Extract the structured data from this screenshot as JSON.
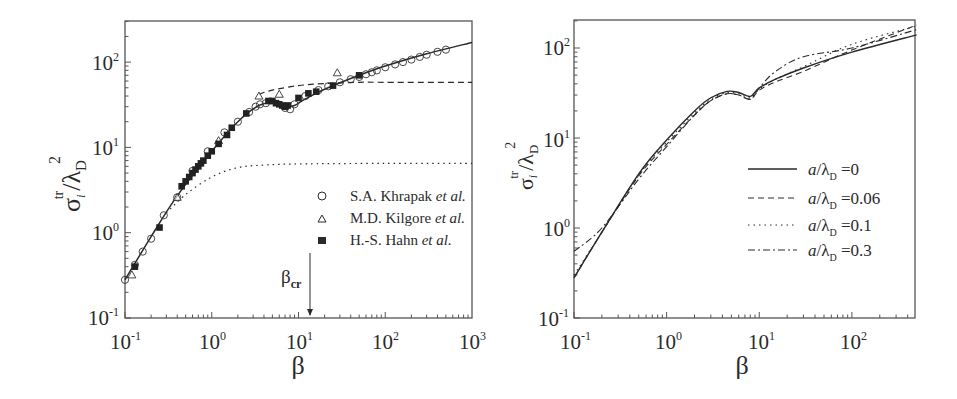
{
  "chart_data": [
    {
      "type": "line",
      "panel": "left",
      "title": "",
      "xlabel": "β",
      "ylabel": "σ_i^tr/λ_D^2",
      "xscale": "log",
      "yscale": "log",
      "xlim": [
        0.1,
        1000
      ],
      "ylim": [
        0.1,
        300
      ],
      "x_tick_labels": [
        "10^-1",
        "10^0",
        "10^1",
        "10^2",
        "10^3"
      ],
      "y_tick_labels": [
        "10^-1",
        "10^0",
        "10^1",
        "10^2"
      ],
      "grid": false,
      "legend_position": "lower right",
      "annotation": {
        "text": "β_cr",
        "x": 13,
        "arrow": "down to x-axis"
      },
      "series": [
        {
          "name": "theory (solid)",
          "style": "solid",
          "x": [
            0.1,
            0.2,
            0.4,
            1,
            2,
            3.5,
            5,
            7,
            9,
            12,
            20,
            50,
            100,
            300,
            1000
          ],
          "y": [
            0.28,
            0.9,
            2.7,
            9,
            20,
            31,
            33,
            30,
            31,
            37,
            48,
            70,
            90,
            125,
            170
          ]
        },
        {
          "name": "dashed asymptote",
          "style": "dashed",
          "x": [
            3.5,
            5,
            10,
            20,
            50,
            100,
            1000
          ],
          "y": [
            42,
            47,
            53,
            56,
            58,
            58,
            58
          ]
        },
        {
          "name": "dotted asymptote",
          "style": "dotted",
          "x": [
            0.3,
            0.5,
            1,
            2,
            4,
            10,
            100,
            1000
          ],
          "y": [
            1.7,
            2.8,
            4.5,
            5.8,
            6.2,
            6.4,
            6.5,
            6.5
          ]
        },
        {
          "name": "S.A. Khrapak et al.",
          "marker": "open-circle",
          "x": [
            0.1,
            0.13,
            0.16,
            0.2,
            0.28,
            0.4,
            0.6,
            0.9,
            1.4,
            2,
            2.7,
            3.2,
            3.6,
            4.2,
            7,
            8,
            9,
            12,
            17,
            22,
            30,
            40,
            50,
            60,
            70,
            80,
            100,
            130,
            160,
            200,
            250,
            300,
            400,
            500
          ],
          "y": [
            0.28,
            0.42,
            0.6,
            0.85,
            1.6,
            2.6,
            5.3,
            9,
            15,
            20,
            26,
            30,
            32,
            33,
            29,
            28,
            32,
            40,
            47,
            52,
            58,
            63,
            67,
            72,
            76,
            80,
            87,
            94,
            100,
            107,
            115,
            122,
            132,
            140
          ]
        },
        {
          "name": "M.D. Kilgore et al.",
          "marker": "open-triangle",
          "x": [
            0.12,
            0.4,
            1.2,
            3.5,
            6,
            28
          ],
          "y": [
            0.32,
            2.6,
            12,
            40,
            42,
            75
          ]
        },
        {
          "name": "H.-S. Hahn et al.",
          "marker": "filled-square",
          "x": [
            0.13,
            0.25,
            0.45,
            0.5,
            0.55,
            0.6,
            0.65,
            0.7,
            0.75,
            0.8,
            0.9,
            1.0,
            1.2,
            1.5,
            1.7,
            2.5,
            4.5,
            5,
            5.5,
            6,
            6.5,
            7,
            7.5,
            10,
            13,
            16,
            25,
            50
          ],
          "y": [
            0.4,
            1.15,
            3.5,
            4.0,
            4.5,
            5.0,
            5.5,
            6.0,
            6.5,
            7.0,
            8.0,
            9.0,
            11,
            14,
            17,
            25,
            35,
            35,
            33,
            32,
            31,
            30,
            31,
            38,
            43,
            45,
            53,
            70
          ]
        }
      ]
    },
    {
      "type": "line",
      "panel": "right",
      "title": "",
      "xlabel": "β",
      "ylabel": "σ_i^tr/λ_D^2",
      "xscale": "log",
      "yscale": "log",
      "xlim": [
        0.1,
        500
      ],
      "ylim": [
        0.1,
        200
      ],
      "x_tick_labels": [
        "10^-1",
        "10^0",
        "10^1",
        "10^2"
      ],
      "y_tick_labels": [
        "10^-1",
        "10^0",
        "10^1",
        "10^2"
      ],
      "grid": false,
      "legend_position": "center right",
      "series": [
        {
          "name": "a/λ_D =0",
          "style": "solid",
          "x": [
            0.1,
            0.2,
            0.5,
            1,
            2,
            3,
            4.5,
            6,
            8,
            10,
            15,
            30,
            100,
            500
          ],
          "y": [
            0.28,
            0.9,
            4,
            9.5,
            20,
            28,
            33,
            32,
            29,
            36,
            45,
            60,
            90,
            140
          ]
        },
        {
          "name": "a/λ_D =0.06",
          "style": "dashed",
          "x": [
            0.1,
            0.2,
            0.5,
            1,
            2,
            3,
            4.5,
            6,
            8,
            10,
            15,
            30,
            100,
            500
          ],
          "y": [
            0.28,
            0.9,
            3.8,
            8.5,
            18,
            26,
            31,
            30,
            27,
            34,
            42,
            55,
            95,
            180
          ]
        },
        {
          "name": "a/λ_D =0.1",
          "style": "dotted",
          "x": [
            0.1,
            0.2,
            0.5,
            1,
            2,
            3,
            4.5,
            6,
            8,
            10,
            15,
            30,
            100,
            500
          ],
          "y": [
            0.3,
            0.9,
            3.9,
            9,
            19,
            27,
            32,
            31,
            28,
            35,
            45,
            62,
            110,
            175
          ]
        },
        {
          "name": "a/λ_D =0.3",
          "style": "dash-dot",
          "x": [
            0.1,
            0.2,
            0.5,
            1,
            2,
            3,
            4.5,
            6,
            8,
            10,
            15,
            30,
            100,
            500
          ],
          "y": [
            0.55,
            1.0,
            3.5,
            8,
            18,
            26,
            31,
            30,
            27,
            36,
            55,
            80,
            100,
            160
          ]
        }
      ]
    }
  ],
  "left": {
    "ylabel": {
      "main": "σ",
      "sub": "i",
      "sup": "tr",
      "slash": "/λ",
      "sub2": "D",
      "sup2": "2"
    },
    "xlabel": "β",
    "x_ticks": [
      {
        "base": "10",
        "exp": "-1"
      },
      {
        "base": "10",
        "exp": "0"
      },
      {
        "base": "10",
        "exp": "1"
      },
      {
        "base": "10",
        "exp": "2"
      },
      {
        "base": "10",
        "exp": "3"
      }
    ],
    "y_ticks": [
      {
        "base": "10",
        "exp": "-1"
      },
      {
        "base": "10",
        "exp": "0"
      },
      {
        "base": "10",
        "exp": "1"
      },
      {
        "base": "10",
        "exp": "2"
      }
    ],
    "annotation": {
      "main": "β",
      "sub": "cr"
    },
    "legend": [
      {
        "name": "S.A. Khrapak",
        "etal": "et al."
      },
      {
        "name": "M.D. Kilgore",
        "etal": "et al."
      },
      {
        "name": "H.-S. Hahn",
        "etal": "et al."
      }
    ]
  },
  "right": {
    "ylabel": {
      "main": "σ",
      "sub": "i",
      "sup": "tr",
      "slash": "/λ",
      "sub2": "D",
      "sup2": "2"
    },
    "xlabel": "β",
    "x_ticks": [
      {
        "base": "10",
        "exp": "-1"
      },
      {
        "base": "10",
        "exp": "0"
      },
      {
        "base": "10",
        "exp": "1"
      },
      {
        "base": "10",
        "exp": "2"
      }
    ],
    "y_ticks": [
      {
        "base": "10",
        "exp": "-1"
      },
      {
        "base": "10",
        "exp": "0"
      },
      {
        "base": "10",
        "exp": "1"
      },
      {
        "base": "10",
        "exp": "2"
      }
    ],
    "legend": [
      {
        "a": "a",
        "lam": "/λ",
        "sub": "D",
        "val": " =0"
      },
      {
        "a": "a",
        "lam": "/λ",
        "sub": "D",
        "val": " =0.06"
      },
      {
        "a": "a",
        "lam": "/λ",
        "sub": "D",
        "val": " =0.1"
      },
      {
        "a": "a",
        "lam": "/λ",
        "sub": "D",
        "val": " =0.3"
      }
    ]
  },
  "colors": {
    "ink": "#2a2a2a",
    "frame": "#555555",
    "background": "#ffffff"
  }
}
